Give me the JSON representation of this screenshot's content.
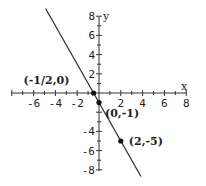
{
  "chart_data": {
    "type": "line",
    "title": "",
    "xlabel": "x",
    "ylabel": "y",
    "xlim": [
      -8,
      8
    ],
    "ylim": [
      -8,
      8
    ],
    "grid": false,
    "x_ticks": [
      -6,
      -4,
      -2,
      2,
      4,
      6,
      8
    ],
    "y_ticks": [
      8,
      6,
      4,
      2,
      -4,
      -6,
      -8
    ],
    "x_tick_labels": [
      "-6",
      "-4",
      "-2",
      "2",
      "4",
      "6",
      "8"
    ],
    "y_tick_labels": [
      "8",
      "6",
      "4",
      "2",
      "-4",
      "-6",
      "-8"
    ],
    "series": [
      {
        "name": "y = -2x - 1",
        "slope": -2,
        "intercept": -1,
        "x": [
          -4.9,
          3.85
        ],
        "y": [
          8.8,
          -8.7
        ]
      }
    ],
    "points": [
      {
        "x": -0.5,
        "y": 0,
        "label": "(-1/2,0)"
      },
      {
        "x": 0,
        "y": -1,
        "label": "(0,-1)"
      },
      {
        "x": 2,
        "y": -5,
        "label": "(2,-5)"
      }
    ]
  }
}
